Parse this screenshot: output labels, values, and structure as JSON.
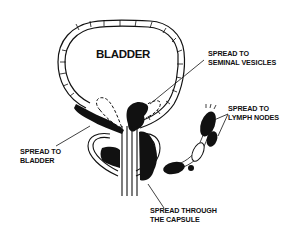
{
  "diagram": {
    "organ_label": "BLADDER",
    "labels": {
      "seminal_vesicles": [
        "SPREAD TO",
        "SEMINAL VESICLES"
      ],
      "lymph_nodes": [
        "SPREAD TO",
        "LYMPH NODES"
      ],
      "bladder": [
        "SPREAD TO",
        "BLADDER"
      ],
      "capsule": [
        "SPREAD THROUGH",
        "THE CAPSULE"
      ]
    },
    "colors": {
      "ink": "#111111",
      "background": "#ffffff"
    }
  }
}
